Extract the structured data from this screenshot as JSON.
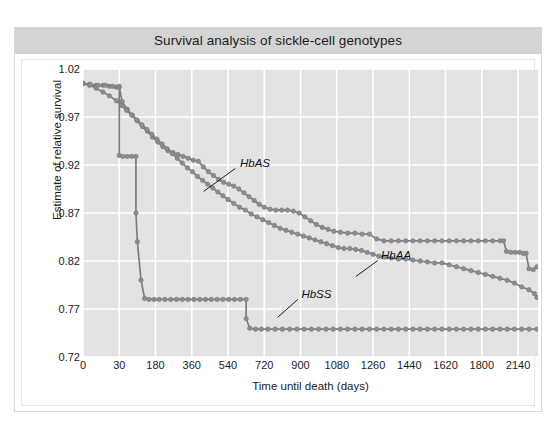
{
  "figure": {
    "title": "Survival analysis of sickle-cell genotypes"
  },
  "chart_data": {
    "type": "line",
    "title": "Survival analysis of sickle-cell genotypes",
    "xlabel": "Time until death (days)",
    "ylabel": "Estimate of relative survival",
    "grid": true,
    "legend_position": "inline-annotations",
    "x_tick_labels": [
      "0",
      "30",
      "180",
      "360",
      "540",
      "720",
      "900",
      "1080",
      "1260",
      "1440",
      "1620",
      "1800",
      "2140"
    ],
    "y_tick_labels": [
      "1.02",
      "0.97",
      "0.92",
      "0.87",
      "0.82",
      "0.77",
      "0.72"
    ],
    "y_tick_values": [
      1.02,
      0.97,
      0.92,
      0.87,
      0.82,
      0.77,
      0.72
    ],
    "ylim": [
      0.72,
      1.02
    ],
    "x_index_range": [
      0,
      12
    ],
    "marker": "circle",
    "marker_color": "#8d8d8d",
    "line_color": "#7c7c7c",
    "plot_background": "#e3e3e3",
    "gridline_color": "#ffffff",
    "series": [
      {
        "name": "HbAS",
        "annotation_label": "HbAS",
        "points": [
          [
            0.0,
            1.005
          ],
          [
            0.18,
            1.004
          ],
          [
            0.36,
            1.003
          ],
          [
            0.55,
            1.003
          ],
          [
            0.73,
            1.002
          ],
          [
            0.92,
            1.001
          ],
          [
            1.0,
            1.001
          ],
          [
            1.08,
            0.986
          ],
          [
            1.22,
            0.978
          ],
          [
            1.36,
            0.972
          ],
          [
            1.5,
            0.966
          ],
          [
            1.64,
            0.96
          ],
          [
            1.78,
            0.955
          ],
          [
            1.92,
            0.949
          ],
          [
            2.06,
            0.944
          ],
          [
            2.2,
            0.939
          ],
          [
            2.34,
            0.935
          ],
          [
            2.48,
            0.933
          ],
          [
            2.62,
            0.931
          ],
          [
            2.76,
            0.929
          ],
          [
            2.9,
            0.927
          ],
          [
            3.04,
            0.925
          ],
          [
            3.18,
            0.924
          ],
          [
            3.32,
            0.918
          ],
          [
            3.46,
            0.913
          ],
          [
            3.6,
            0.909
          ],
          [
            3.74,
            0.905
          ],
          [
            3.88,
            0.902
          ],
          [
            4.02,
            0.9
          ],
          [
            4.16,
            0.898
          ],
          [
            4.3,
            0.895
          ],
          [
            4.44,
            0.891
          ],
          [
            4.58,
            0.887
          ],
          [
            4.72,
            0.883
          ],
          [
            4.86,
            0.879
          ],
          [
            5.0,
            0.876
          ],
          [
            5.16,
            0.874
          ],
          [
            5.32,
            0.873
          ],
          [
            5.48,
            0.873
          ],
          [
            5.64,
            0.873
          ],
          [
            5.8,
            0.872
          ],
          [
            5.96,
            0.87
          ],
          [
            6.12,
            0.866
          ],
          [
            6.28,
            0.862
          ],
          [
            6.44,
            0.858
          ],
          [
            6.6,
            0.855
          ],
          [
            6.76,
            0.853
          ],
          [
            6.92,
            0.851
          ],
          [
            7.1,
            0.85
          ],
          [
            7.3,
            0.849
          ],
          [
            7.5,
            0.849
          ],
          [
            7.7,
            0.848
          ],
          [
            7.9,
            0.848
          ],
          [
            8.1,
            0.843
          ],
          [
            8.3,
            0.841
          ],
          [
            8.5,
            0.841
          ],
          [
            8.7,
            0.841
          ],
          [
            8.9,
            0.841
          ],
          [
            9.1,
            0.841
          ],
          [
            9.3,
            0.841
          ],
          [
            9.5,
            0.841
          ],
          [
            9.7,
            0.841
          ],
          [
            9.9,
            0.841
          ],
          [
            10.1,
            0.841
          ],
          [
            10.3,
            0.841
          ],
          [
            10.5,
            0.841
          ],
          [
            10.7,
            0.841
          ],
          [
            10.9,
            0.841
          ],
          [
            11.1,
            0.841
          ],
          [
            11.3,
            0.841
          ],
          [
            11.5,
            0.841
          ],
          [
            11.6,
            0.841
          ],
          [
            11.68,
            0.83
          ],
          [
            11.8,
            0.829
          ],
          [
            11.92,
            0.829
          ],
          [
            12.04,
            0.829
          ],
          [
            12.14,
            0.828
          ],
          [
            12.22,
            0.828
          ],
          [
            12.3,
            0.812
          ],
          [
            12.42,
            0.811
          ],
          [
            12.52,
            0.814
          ]
        ]
      },
      {
        "name": "HbAA",
        "annotation_label": "HbAA",
        "points": [
          [
            0.0,
            1.005
          ],
          [
            0.18,
            1.003
          ],
          [
            0.36,
            1.0
          ],
          [
            0.55,
            0.996
          ],
          [
            0.73,
            0.992
          ],
          [
            0.92,
            0.987
          ],
          [
            1.06,
            0.982
          ],
          [
            1.2,
            0.977
          ],
          [
            1.34,
            0.972
          ],
          [
            1.48,
            0.967
          ],
          [
            1.62,
            0.962
          ],
          [
            1.76,
            0.957
          ],
          [
            1.9,
            0.952
          ],
          [
            2.04,
            0.947
          ],
          [
            2.18,
            0.942
          ],
          [
            2.32,
            0.937
          ],
          [
            2.46,
            0.932
          ],
          [
            2.6,
            0.927
          ],
          [
            2.74,
            0.922
          ],
          [
            2.88,
            0.917
          ],
          [
            3.02,
            0.913
          ],
          [
            3.16,
            0.908
          ],
          [
            3.3,
            0.904
          ],
          [
            3.44,
            0.9
          ],
          [
            3.58,
            0.896
          ],
          [
            3.72,
            0.892
          ],
          [
            3.86,
            0.888
          ],
          [
            4.0,
            0.884
          ],
          [
            4.16,
            0.88
          ],
          [
            4.32,
            0.876
          ],
          [
            4.48,
            0.873
          ],
          [
            4.64,
            0.869
          ],
          [
            4.8,
            0.866
          ],
          [
            4.96,
            0.863
          ],
          [
            5.12,
            0.86
          ],
          [
            5.28,
            0.857
          ],
          [
            5.44,
            0.854
          ],
          [
            5.6,
            0.852
          ],
          [
            5.76,
            0.85
          ],
          [
            5.92,
            0.848
          ],
          [
            6.08,
            0.846
          ],
          [
            6.24,
            0.844
          ],
          [
            6.4,
            0.842
          ],
          [
            6.56,
            0.84
          ],
          [
            6.72,
            0.838
          ],
          [
            6.88,
            0.836
          ],
          [
            7.04,
            0.834
          ],
          [
            7.2,
            0.833
          ],
          [
            7.36,
            0.833
          ],
          [
            7.52,
            0.832
          ],
          [
            7.68,
            0.831
          ],
          [
            7.84,
            0.829
          ],
          [
            8.0,
            0.827
          ],
          [
            8.16,
            0.825
          ],
          [
            8.32,
            0.824
          ],
          [
            8.5,
            0.823
          ],
          [
            8.7,
            0.822
          ],
          [
            8.9,
            0.822
          ],
          [
            9.1,
            0.821
          ],
          [
            9.3,
            0.82
          ],
          [
            9.5,
            0.819
          ],
          [
            9.7,
            0.818
          ],
          [
            9.9,
            0.818
          ],
          [
            10.1,
            0.816
          ],
          [
            10.3,
            0.814
          ],
          [
            10.5,
            0.812
          ],
          [
            10.7,
            0.81
          ],
          [
            10.9,
            0.808
          ],
          [
            11.1,
            0.806
          ],
          [
            11.3,
            0.804
          ],
          [
            11.5,
            0.802
          ],
          [
            11.7,
            0.8
          ],
          [
            11.9,
            0.797
          ],
          [
            12.1,
            0.793
          ],
          [
            12.3,
            0.79
          ],
          [
            12.45,
            0.786
          ],
          [
            12.52,
            0.782
          ]
        ]
      },
      {
        "name": "HbSS",
        "annotation_label": "HbSS",
        "points": [
          [
            0.0,
            1.005
          ],
          [
            0.2,
            1.004
          ],
          [
            0.42,
            1.003
          ],
          [
            0.62,
            1.003
          ],
          [
            0.82,
            1.002
          ],
          [
            1.0,
            1.002
          ],
          [
            1.0,
            0.93
          ],
          [
            1.1,
            0.929
          ],
          [
            1.22,
            0.929
          ],
          [
            1.34,
            0.929
          ],
          [
            1.46,
            0.929
          ],
          [
            1.46,
            0.87
          ],
          [
            1.5,
            0.84
          ],
          [
            1.6,
            0.8
          ],
          [
            1.7,
            0.781
          ],
          [
            1.82,
            0.78
          ],
          [
            1.96,
            0.78
          ],
          [
            2.1,
            0.78
          ],
          [
            2.26,
            0.78
          ],
          [
            2.42,
            0.78
          ],
          [
            2.58,
            0.78
          ],
          [
            2.74,
            0.78
          ],
          [
            2.9,
            0.78
          ],
          [
            3.06,
            0.78
          ],
          [
            3.22,
            0.78
          ],
          [
            3.38,
            0.78
          ],
          [
            3.54,
            0.78
          ],
          [
            3.7,
            0.78
          ],
          [
            3.86,
            0.78
          ],
          [
            4.02,
            0.78
          ],
          [
            4.18,
            0.78
          ],
          [
            4.34,
            0.78
          ],
          [
            4.5,
            0.78
          ],
          [
            4.5,
            0.76
          ],
          [
            4.6,
            0.75
          ],
          [
            4.76,
            0.749
          ],
          [
            4.92,
            0.749
          ],
          [
            5.1,
            0.749
          ],
          [
            5.3,
            0.749
          ],
          [
            5.5,
            0.749
          ],
          [
            5.7,
            0.749
          ],
          [
            5.9,
            0.749
          ],
          [
            6.1,
            0.749
          ],
          [
            6.3,
            0.749
          ],
          [
            6.5,
            0.749
          ],
          [
            6.7,
            0.749
          ],
          [
            6.9,
            0.749
          ],
          [
            7.1,
            0.749
          ],
          [
            7.3,
            0.749
          ],
          [
            7.5,
            0.749
          ],
          [
            7.7,
            0.749
          ],
          [
            7.9,
            0.749
          ],
          [
            8.1,
            0.749
          ],
          [
            8.3,
            0.749
          ],
          [
            8.5,
            0.749
          ],
          [
            8.7,
            0.749
          ],
          [
            8.9,
            0.749
          ],
          [
            9.1,
            0.749
          ],
          [
            9.3,
            0.749
          ],
          [
            9.5,
            0.749
          ],
          [
            9.7,
            0.749
          ],
          [
            9.9,
            0.749
          ],
          [
            10.1,
            0.749
          ],
          [
            10.3,
            0.749
          ],
          [
            10.5,
            0.749
          ],
          [
            10.7,
            0.749
          ],
          [
            10.9,
            0.749
          ],
          [
            11.1,
            0.749
          ],
          [
            11.3,
            0.749
          ],
          [
            11.5,
            0.749
          ],
          [
            11.7,
            0.749
          ],
          [
            11.9,
            0.749
          ],
          [
            12.1,
            0.749
          ],
          [
            12.3,
            0.749
          ],
          [
            12.52,
            0.749
          ]
        ]
      }
    ],
    "annotations": [
      {
        "label": "HbAS",
        "text_x": 0.345,
        "text_y": 0.305,
        "leader_from_x": 0.335,
        "leader_from_y": 0.345,
        "leader_to_x": 0.265,
        "leader_to_y": 0.425
      },
      {
        "label": "HbAA",
        "text_x": 0.655,
        "text_y": 0.625,
        "leader_from_x": 0.648,
        "leader_from_y": 0.665,
        "leader_to_x": 0.6,
        "leader_to_y": 0.72
      },
      {
        "label": "HbSS",
        "text_x": 0.48,
        "text_y": 0.76,
        "leader_from_x": 0.472,
        "leader_from_y": 0.8,
        "leader_to_x": 0.428,
        "leader_to_y": 0.862
      }
    ]
  }
}
